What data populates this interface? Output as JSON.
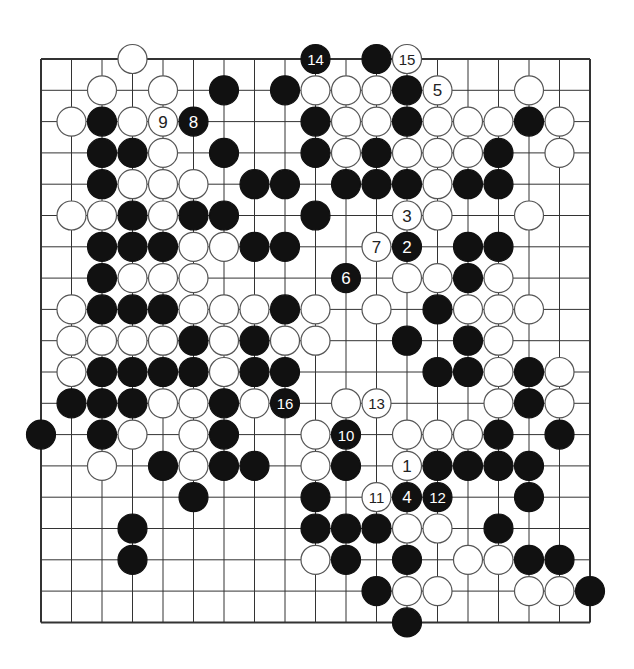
{
  "diagram": {
    "type": "go-problem",
    "board_size": 19,
    "colors": {
      "background": "#ffffff",
      "line": "#333333",
      "black": "#111111",
      "white": "#ffffff",
      "white_outline": "#555555"
    },
    "geometry": {
      "x0": 41,
      "y0": 59,
      "dx": 30.5,
      "dy": 31.3,
      "radius": 14.5
    },
    "stones": [
      {
        "c": 3,
        "r": 0,
        "color": "W"
      },
      {
        "c": 9,
        "r": 0,
        "color": "B",
        "label": "14"
      },
      {
        "c": 11,
        "r": 0,
        "color": "B"
      },
      {
        "c": 12,
        "r": 0,
        "color": "W",
        "label": "15"
      },
      {
        "c": 2,
        "r": 1,
        "color": "W"
      },
      {
        "c": 4,
        "r": 1,
        "color": "W"
      },
      {
        "c": 6,
        "r": 1,
        "color": "B"
      },
      {
        "c": 8,
        "r": 1,
        "color": "B"
      },
      {
        "c": 9,
        "r": 1,
        "color": "W"
      },
      {
        "c": 10,
        "r": 1,
        "color": "W"
      },
      {
        "c": 11,
        "r": 1,
        "color": "W"
      },
      {
        "c": 12,
        "r": 1,
        "color": "B"
      },
      {
        "c": 13,
        "r": 1,
        "color": "W",
        "label": "5"
      },
      {
        "c": 16,
        "r": 1,
        "color": "W"
      },
      {
        "c": 1,
        "r": 2,
        "color": "W"
      },
      {
        "c": 2,
        "r": 2,
        "color": "B"
      },
      {
        "c": 3,
        "r": 2,
        "color": "W"
      },
      {
        "c": 4,
        "r": 2,
        "color": "W",
        "label": "9"
      },
      {
        "c": 5,
        "r": 2,
        "color": "B",
        "label": "8"
      },
      {
        "c": 9,
        "r": 2,
        "color": "B"
      },
      {
        "c": 10,
        "r": 2,
        "color": "W"
      },
      {
        "c": 11,
        "r": 2,
        "color": "W"
      },
      {
        "c": 12,
        "r": 2,
        "color": "B"
      },
      {
        "c": 13,
        "r": 2,
        "color": "W"
      },
      {
        "c": 14,
        "r": 2,
        "color": "W"
      },
      {
        "c": 15,
        "r": 2,
        "color": "W"
      },
      {
        "c": 16,
        "r": 2,
        "color": "B"
      },
      {
        "c": 17,
        "r": 2,
        "color": "W"
      },
      {
        "c": 2,
        "r": 3,
        "color": "B"
      },
      {
        "c": 3,
        "r": 3,
        "color": "B"
      },
      {
        "c": 4,
        "r": 3,
        "color": "W"
      },
      {
        "c": 6,
        "r": 3,
        "color": "B"
      },
      {
        "c": 9,
        "r": 3,
        "color": "B"
      },
      {
        "c": 10,
        "r": 3,
        "color": "W"
      },
      {
        "c": 11,
        "r": 3,
        "color": "B"
      },
      {
        "c": 12,
        "r": 3,
        "color": "W"
      },
      {
        "c": 13,
        "r": 3,
        "color": "W"
      },
      {
        "c": 14,
        "r": 3,
        "color": "W"
      },
      {
        "c": 15,
        "r": 3,
        "color": "B"
      },
      {
        "c": 17,
        "r": 3,
        "color": "W"
      },
      {
        "c": 2,
        "r": 4,
        "color": "B"
      },
      {
        "c": 3,
        "r": 4,
        "color": "W"
      },
      {
        "c": 4,
        "r": 4,
        "color": "W"
      },
      {
        "c": 5,
        "r": 4,
        "color": "W"
      },
      {
        "c": 7,
        "r": 4,
        "color": "B"
      },
      {
        "c": 8,
        "r": 4,
        "color": "B"
      },
      {
        "c": 10,
        "r": 4,
        "color": "B"
      },
      {
        "c": 11,
        "r": 4,
        "color": "B"
      },
      {
        "c": 12,
        "r": 4,
        "color": "B"
      },
      {
        "c": 13,
        "r": 4,
        "color": "W"
      },
      {
        "c": 14,
        "r": 4,
        "color": "B"
      },
      {
        "c": 15,
        "r": 4,
        "color": "B"
      },
      {
        "c": 1,
        "r": 5,
        "color": "W"
      },
      {
        "c": 2,
        "r": 5,
        "color": "W"
      },
      {
        "c": 3,
        "r": 5,
        "color": "B"
      },
      {
        "c": 4,
        "r": 5,
        "color": "W"
      },
      {
        "c": 5,
        "r": 5,
        "color": "B"
      },
      {
        "c": 6,
        "r": 5,
        "color": "B"
      },
      {
        "c": 9,
        "r": 5,
        "color": "B"
      },
      {
        "c": 12,
        "r": 5,
        "color": "W",
        "label": "3"
      },
      {
        "c": 13,
        "r": 5,
        "color": "W"
      },
      {
        "c": 16,
        "r": 5,
        "color": "W"
      },
      {
        "c": 2,
        "r": 6,
        "color": "B"
      },
      {
        "c": 3,
        "r": 6,
        "color": "B"
      },
      {
        "c": 4,
        "r": 6,
        "color": "B"
      },
      {
        "c": 5,
        "r": 6,
        "color": "W"
      },
      {
        "c": 6,
        "r": 6,
        "color": "W"
      },
      {
        "c": 7,
        "r": 6,
        "color": "B"
      },
      {
        "c": 8,
        "r": 6,
        "color": "B"
      },
      {
        "c": 11,
        "r": 6,
        "color": "W",
        "label": "7"
      },
      {
        "c": 12,
        "r": 6,
        "color": "B",
        "label": "2"
      },
      {
        "c": 14,
        "r": 6,
        "color": "B"
      },
      {
        "c": 15,
        "r": 6,
        "color": "B"
      },
      {
        "c": 2,
        "r": 7,
        "color": "B"
      },
      {
        "c": 3,
        "r": 7,
        "color": "W"
      },
      {
        "c": 4,
        "r": 7,
        "color": "W"
      },
      {
        "c": 5,
        "r": 7,
        "color": "W"
      },
      {
        "c": 10,
        "r": 7,
        "color": "B",
        "label": "6"
      },
      {
        "c": 12,
        "r": 7,
        "color": "W"
      },
      {
        "c": 13,
        "r": 7,
        "color": "W"
      },
      {
        "c": 14,
        "r": 7,
        "color": "B"
      },
      {
        "c": 15,
        "r": 7,
        "color": "W"
      },
      {
        "c": 1,
        "r": 8,
        "color": "W"
      },
      {
        "c": 2,
        "r": 8,
        "color": "B"
      },
      {
        "c": 3,
        "r": 8,
        "color": "B"
      },
      {
        "c": 4,
        "r": 8,
        "color": "B"
      },
      {
        "c": 5,
        "r": 8,
        "color": "W"
      },
      {
        "c": 6,
        "r": 8,
        "color": "W"
      },
      {
        "c": 7,
        "r": 8,
        "color": "W"
      },
      {
        "c": 8,
        "r": 8,
        "color": "B"
      },
      {
        "c": 9,
        "r": 8,
        "color": "W"
      },
      {
        "c": 11,
        "r": 8,
        "color": "W"
      },
      {
        "c": 13,
        "r": 8,
        "color": "B"
      },
      {
        "c": 14,
        "r": 8,
        "color": "W"
      },
      {
        "c": 15,
        "r": 8,
        "color": "W"
      },
      {
        "c": 16,
        "r": 8,
        "color": "W"
      },
      {
        "c": 1,
        "r": 9,
        "color": "W"
      },
      {
        "c": 2,
        "r": 9,
        "color": "W"
      },
      {
        "c": 3,
        "r": 9,
        "color": "W"
      },
      {
        "c": 4,
        "r": 9,
        "color": "W"
      },
      {
        "c": 5,
        "r": 9,
        "color": "B"
      },
      {
        "c": 6,
        "r": 9,
        "color": "W"
      },
      {
        "c": 7,
        "r": 9,
        "color": "B"
      },
      {
        "c": 8,
        "r": 9,
        "color": "W"
      },
      {
        "c": 9,
        "r": 9,
        "color": "W"
      },
      {
        "c": 12,
        "r": 9,
        "color": "B"
      },
      {
        "c": 14,
        "r": 9,
        "color": "B"
      },
      {
        "c": 15,
        "r": 9,
        "color": "W"
      },
      {
        "c": 1,
        "r": 10,
        "color": "W"
      },
      {
        "c": 2,
        "r": 10,
        "color": "B"
      },
      {
        "c": 3,
        "r": 10,
        "color": "B"
      },
      {
        "c": 4,
        "r": 10,
        "color": "B"
      },
      {
        "c": 5,
        "r": 10,
        "color": "B"
      },
      {
        "c": 6,
        "r": 10,
        "color": "W"
      },
      {
        "c": 7,
        "r": 10,
        "color": "B"
      },
      {
        "c": 8,
        "r": 10,
        "color": "B"
      },
      {
        "c": 13,
        "r": 10,
        "color": "B"
      },
      {
        "c": 14,
        "r": 10,
        "color": "B"
      },
      {
        "c": 15,
        "r": 10,
        "color": "W"
      },
      {
        "c": 16,
        "r": 10,
        "color": "B"
      },
      {
        "c": 17,
        "r": 10,
        "color": "W"
      },
      {
        "c": 1,
        "r": 11,
        "color": "B"
      },
      {
        "c": 2,
        "r": 11,
        "color": "B"
      },
      {
        "c": 3,
        "r": 11,
        "color": "B"
      },
      {
        "c": 4,
        "r": 11,
        "color": "W"
      },
      {
        "c": 5,
        "r": 11,
        "color": "W"
      },
      {
        "c": 6,
        "r": 11,
        "color": "B"
      },
      {
        "c": 7,
        "r": 11,
        "color": "W"
      },
      {
        "c": 8,
        "r": 11,
        "color": "B",
        "label": "16"
      },
      {
        "c": 10,
        "r": 11,
        "color": "W"
      },
      {
        "c": 11,
        "r": 11,
        "color": "W",
        "label": "13"
      },
      {
        "c": 15,
        "r": 11,
        "color": "W"
      },
      {
        "c": 16,
        "r": 11,
        "color": "B"
      },
      {
        "c": 17,
        "r": 11,
        "color": "W"
      },
      {
        "c": 0,
        "r": 12,
        "color": "B"
      },
      {
        "c": 2,
        "r": 12,
        "color": "B"
      },
      {
        "c": 3,
        "r": 12,
        "color": "W"
      },
      {
        "c": 5,
        "r": 12,
        "color": "W"
      },
      {
        "c": 6,
        "r": 12,
        "color": "B"
      },
      {
        "c": 9,
        "r": 12,
        "color": "W"
      },
      {
        "c": 10,
        "r": 12,
        "color": "B",
        "label": "10"
      },
      {
        "c": 12,
        "r": 12,
        "color": "W"
      },
      {
        "c": 13,
        "r": 12,
        "color": "W"
      },
      {
        "c": 14,
        "r": 12,
        "color": "W"
      },
      {
        "c": 15,
        "r": 12,
        "color": "B"
      },
      {
        "c": 17,
        "r": 12,
        "color": "B"
      },
      {
        "c": 2,
        "r": 13,
        "color": "W"
      },
      {
        "c": 4,
        "r": 13,
        "color": "B"
      },
      {
        "c": 5,
        "r": 13,
        "color": "W"
      },
      {
        "c": 6,
        "r": 13,
        "color": "B"
      },
      {
        "c": 7,
        "r": 13,
        "color": "B"
      },
      {
        "c": 9,
        "r": 13,
        "color": "W"
      },
      {
        "c": 10,
        "r": 13,
        "color": "B"
      },
      {
        "c": 12,
        "r": 13,
        "color": "W",
        "label": "1"
      },
      {
        "c": 13,
        "r": 13,
        "color": "B"
      },
      {
        "c": 14,
        "r": 13,
        "color": "B"
      },
      {
        "c": 15,
        "r": 13,
        "color": "B"
      },
      {
        "c": 16,
        "r": 13,
        "color": "B"
      },
      {
        "c": 5,
        "r": 14,
        "color": "B"
      },
      {
        "c": 9,
        "r": 14,
        "color": "B"
      },
      {
        "c": 11,
        "r": 14,
        "color": "W",
        "label": "11"
      },
      {
        "c": 12,
        "r": 14,
        "color": "B",
        "label": "4"
      },
      {
        "c": 13,
        "r": 14,
        "color": "B",
        "label": "12"
      },
      {
        "c": 16,
        "r": 14,
        "color": "B"
      },
      {
        "c": 3,
        "r": 15,
        "color": "B"
      },
      {
        "c": 9,
        "r": 15,
        "color": "B"
      },
      {
        "c": 10,
        "r": 15,
        "color": "B"
      },
      {
        "c": 11,
        "r": 15,
        "color": "B"
      },
      {
        "c": 12,
        "r": 15,
        "color": "W"
      },
      {
        "c": 13,
        "r": 15,
        "color": "W"
      },
      {
        "c": 15,
        "r": 15,
        "color": "B"
      },
      {
        "c": 3,
        "r": 16,
        "color": "B"
      },
      {
        "c": 9,
        "r": 16,
        "color": "W"
      },
      {
        "c": 10,
        "r": 16,
        "color": "B"
      },
      {
        "c": 12,
        "r": 16,
        "color": "B"
      },
      {
        "c": 14,
        "r": 16,
        "color": "W"
      },
      {
        "c": 15,
        "r": 16,
        "color": "W"
      },
      {
        "c": 16,
        "r": 16,
        "color": "B"
      },
      {
        "c": 17,
        "r": 16,
        "color": "B"
      },
      {
        "c": 11,
        "r": 17,
        "color": "B"
      },
      {
        "c": 12,
        "r": 17,
        "color": "W"
      },
      {
        "c": 13,
        "r": 17,
        "color": "W"
      },
      {
        "c": 16,
        "r": 17,
        "color": "W"
      },
      {
        "c": 17,
        "r": 17,
        "color": "W"
      },
      {
        "c": 18,
        "r": 17,
        "color": "B"
      },
      {
        "c": 12,
        "r": 18,
        "color": "B"
      }
    ]
  }
}
